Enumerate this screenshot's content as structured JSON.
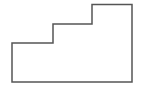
{
  "diagram": {
    "type": "staircase-polygon",
    "stroke_color": "#555555",
    "fill_color": "#ffffff",
    "stroke_width": 1.5,
    "points": "12,82 132,82 132,4.5 92,4.5 92,24 53,24 53,43 12,43"
  }
}
